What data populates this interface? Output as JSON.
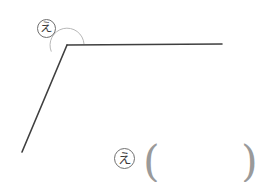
{
  "figure": {
    "background_color": "#ffffff",
    "width": 274,
    "height": 182,
    "stroke_color": "#3f3f3f",
    "arc_color": "#b8b8b8",
    "paren_color": "#9a9a9a",
    "label_border_color": "#6f6f6f",
    "vertex": {
      "x": 67,
      "y": 45
    },
    "rays": [
      {
        "name": "horizontal-ray",
        "from": {
          "x": 67,
          "y": 45
        },
        "to": {
          "x": 222,
          "y": 44
        }
      },
      {
        "name": "diagonal-ray",
        "from": {
          "x": 67,
          "y": 45
        },
        "to": {
          "x": 22,
          "y": 152
        }
      }
    ],
    "angle_arc": {
      "name": "angle-arc",
      "center": {
        "x": 67,
        "y": 45
      },
      "radius": 17,
      "path": "M 84 44 A 17 17 0 1 0 51.3 51.6"
    }
  },
  "labels": {
    "vertex_angle": "え",
    "answer_row_label": "え",
    "paren_open": "(",
    "paren_close": ")",
    "answer_value": ""
  }
}
